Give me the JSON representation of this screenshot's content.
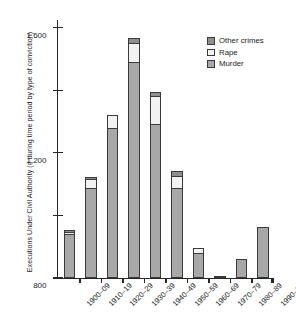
{
  "chart_data": {
    "type": "bar",
    "stacked": true,
    "title": "",
    "xlabel": "",
    "ylabel": "Executions Under Civil Authority (# during time period by type of conviction)",
    "categories": [
      "1900–09",
      "1910–19",
      "1920–29",
      "1930–39",
      "1940–49",
      "1950–59",
      "1960–69",
      "1970–79",
      "1980–89",
      "1990–98"
    ],
    "series": [
      {
        "name": "Murder",
        "color": "#a8a8a8",
        "values": [
          279,
          578,
          959,
          1384,
          984,
          578,
          159,
          12,
          121,
          324
        ]
      },
      {
        "name": "Rape",
        "color": "#f2f2f2",
        "values": [
          10,
          57,
          82,
          120,
          178,
          76,
          32,
          0,
          0,
          0
        ]
      },
      {
        "name": "Other crimes",
        "color": "#8f8f8f",
        "values": [
          9,
          6,
          0,
          32,
          25,
          32,
          0,
          0,
          0,
          0
        ]
      }
    ],
    "totals": [
      298,
      641,
      1041,
      1536,
      1187,
      686,
      191,
      12,
      121,
      324
    ],
    "yticks": [
      0,
      400,
      800,
      1200,
      1600
    ],
    "ytick_labels": [
      "0",
      "400",
      "800",
      "1,200",
      "1,600"
    ],
    "ylim": [
      0,
      1650
    ],
    "grid": false,
    "legend_position": "top-right"
  },
  "legend": {
    "items": [
      {
        "label": "Other crimes",
        "color": "#8f8f8f"
      },
      {
        "label": "Rape",
        "color": "#f2f2f2"
      },
      {
        "label": "Murder",
        "color": "#a8a8a8"
      }
    ]
  }
}
